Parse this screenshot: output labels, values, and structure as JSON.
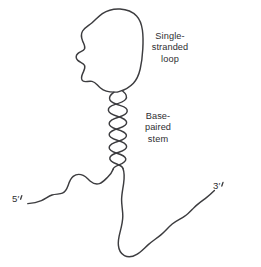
{
  "figure": {
    "background_color": "#ffffff",
    "stroke_color": "#3c3c3f",
    "text_color": "#2e2e31"
  },
  "labels": {
    "loop": "Single-\nstranded\nloop",
    "stem": "Base-\npaired\nstem",
    "five_prime": "5′",
    "three_prime": "3′"
  },
  "diagram_parts": {
    "loop_name": "single-stranded-loop",
    "stem_name": "base-paired-stem",
    "five_prime_tail_name": "five-prime-tail",
    "three_prime_tail_name": "three-prime-tail"
  }
}
